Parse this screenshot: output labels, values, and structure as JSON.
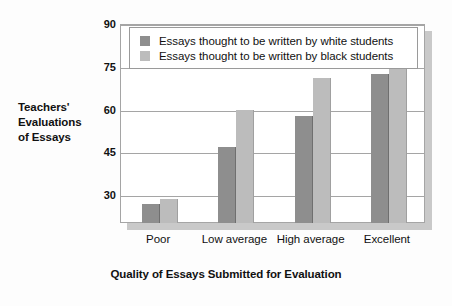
{
  "chart_data": {
    "type": "bar",
    "title": "",
    "xlabel": "Quality of Essays Submitted for Evaluation",
    "ylabel": "Teachers' Evaluations of Essays",
    "ylabel_lines": [
      "Teachers'",
      "Evaluations",
      "of Essays"
    ],
    "categories": [
      "Poor",
      "Low average",
      "High average",
      "Excellent"
    ],
    "series": [
      {
        "name": "Essays thought to be written by white students",
        "color": "#8e8e8e",
        "values": [
          27,
          47,
          58,
          72.5
        ]
      },
      {
        "name": "Essays thought to be written by black students",
        "color": "#bcbcbc",
        "values": [
          29,
          60,
          71,
          76.5
        ]
      }
    ],
    "yticks": [
      90,
      75,
      60,
      45,
      30
    ],
    "ylim": [
      20.5,
      90
    ],
    "grid": true,
    "legend_position": "top-inside"
  },
  "legend": {
    "entries": [
      {
        "label": "Essays thought to be written by white students",
        "color": "#8e8e8e"
      },
      {
        "label": "Essays thought to be written by black students",
        "color": "#bcbcbc"
      }
    ]
  },
  "colors": {
    "white_students_bar": "#8e8e8e",
    "black_students_bar": "#bcbcbc",
    "axis": "#a5a5a5",
    "text": "#111111",
    "plot_background": "#ffffff",
    "figure_background": "#fdfdfd",
    "shadow": "#c9c9c9"
  }
}
